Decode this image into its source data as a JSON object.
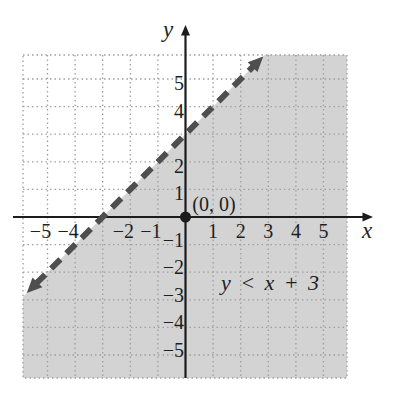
{
  "figure": {
    "x_axis_label": "x",
    "y_axis_label": "y",
    "origin_point_label": "(0, 0)",
    "region_label": "y < x + 3"
  },
  "colors": {
    "shaded_region": "#d3d3d3",
    "grid_dots": "#9f9f9f",
    "axis": "#1c1c1c",
    "dashed_line": "#4e4e4e",
    "text": "#1f1f1f"
  },
  "chart_data": {
    "type": "line",
    "subtype": "linear-inequality-graph",
    "title": "",
    "xlabel": "x",
    "ylabel": "y",
    "xlim": [
      -5.9,
      5.9
    ],
    "ylim": [
      -5.9,
      5.9
    ],
    "grid": true,
    "inequality": "y < x + 3",
    "shaded_region": "below-line",
    "boundary_included": false,
    "boundary_line": {
      "equation": "y = x + 3",
      "slope": 1,
      "y_intercept": 3,
      "x_intercept": -3,
      "style": "dashed",
      "arrows": "both-ends",
      "drawn_from": {
        "x": -5.7,
        "y": -2.7
      },
      "drawn_to": {
        "x": 2.9,
        "y": 5.9
      }
    },
    "test_point": {
      "x": 0,
      "y": 0,
      "label": "(0, 0)"
    },
    "x_ticks": [
      {
        "value": -5,
        "text": "−5"
      },
      {
        "value": -4,
        "text": "−4"
      },
      {
        "value": -2,
        "text": "−2"
      },
      {
        "value": -1,
        "text": "−1"
      },
      {
        "value": 1,
        "text": "1"
      },
      {
        "value": 2,
        "text": "2"
      },
      {
        "value": 3,
        "text": "3"
      },
      {
        "value": 4,
        "text": "4"
      },
      {
        "value": 5,
        "text": "5"
      }
    ],
    "y_ticks": [
      {
        "value": 5,
        "text": "5"
      },
      {
        "value": 4,
        "text": "4"
      },
      {
        "value": 2,
        "text": "2"
      },
      {
        "value": 1,
        "text": "1"
      },
      {
        "value": -1,
        "text": "−1"
      },
      {
        "value": -2,
        "text": "−2"
      },
      {
        "value": -3,
        "text": "−3"
      },
      {
        "value": -4,
        "text": "−4"
      },
      {
        "value": -5,
        "text": "−5"
      }
    ],
    "hidden_tick_labels": {
      "x": [
        -3
      ],
      "y": [
        3
      ]
    },
    "gridline_values": [
      -5,
      -4,
      -3,
      -2,
      -1,
      1,
      2,
      3,
      4,
      5
    ]
  }
}
